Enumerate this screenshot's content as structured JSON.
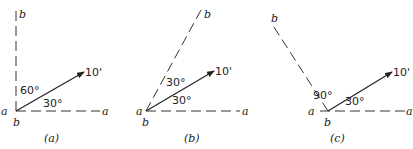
{
  "panels": [
    {
      "id": "a",
      "caption": "(a)",
      "axis_a_start": "a",
      "axis_a_end": "a",
      "axis_b_top": "b",
      "origin_label": "b",
      "vector_label": "10'",
      "angle_vec_a": "30°",
      "angle_vec_b": "60°",
      "angle_between_axes": 90
    },
    {
      "id": "b",
      "caption": "(b)",
      "axis_a_start": "a",
      "axis_a_end": "a",
      "axis_b_top": "b",
      "origin_label": "b",
      "vector_label": "10'",
      "angle_vec_a": "30°",
      "angle_vec_b": "30°",
      "angle_between_axes": 60
    },
    {
      "id": "c",
      "caption": "(c)",
      "axis_a_start": "a",
      "axis_a_end": "a",
      "axis_b_top": "b",
      "origin_label": "b",
      "vector_label": "10'",
      "angle_vec_a": "30°",
      "angle_vec_b": "90°",
      "angle_between_axes": 120
    }
  ]
}
